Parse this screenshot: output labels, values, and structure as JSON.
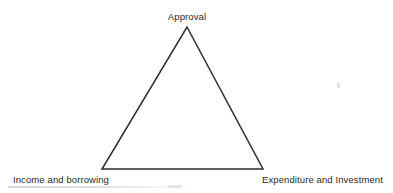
{
  "diagram": {
    "type": "triangle",
    "title": "",
    "stroke_color": "#2b2b2b",
    "background_color": "#ffffff",
    "stroke_width": 1.5,
    "vertices": [
      {
        "id": "apex",
        "label": "Approval",
        "x": 187,
        "y": 27,
        "label_position": "above"
      },
      {
        "id": "bottom-left",
        "label": "Income and borrowing",
        "x": 102,
        "y": 169,
        "label_position": "below-left"
      },
      {
        "id": "bottom-right",
        "label": "Expenditure and Investment",
        "x": 263,
        "y": 169,
        "label_position": "below-right"
      }
    ],
    "edges": [
      {
        "from": "bottom-left",
        "to": "apex"
      },
      {
        "from": "apex",
        "to": "bottom-right"
      },
      {
        "from": "bottom-right",
        "to": "bottom-left"
      }
    ]
  },
  "labels": {
    "apex": "Approval",
    "bottom_left": "Income and borrowing",
    "bottom_right": "Expenditure and Investment"
  }
}
